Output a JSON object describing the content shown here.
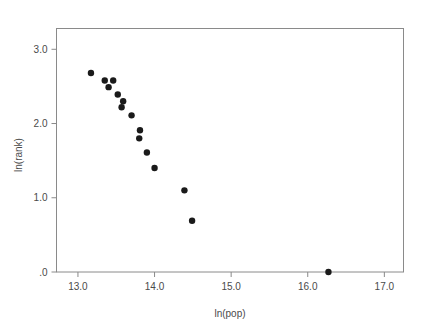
{
  "chart": {
    "type": "scatter",
    "title": "",
    "background_color": "#ffffff",
    "marker_color": "#1a1a1a",
    "axis_color": "#8a8a8a",
    "text_color": "#4a4a4a"
  },
  "chart_data": {
    "type": "scatter",
    "title": "",
    "subtitle": "",
    "xlabel": "ln(pop)",
    "ylabel": "ln(rank)",
    "xlim": [
      12.72,
      17.25
    ],
    "ylim": [
      0.0,
      3.28
    ],
    "grid": false,
    "legend": null,
    "xticks": [
      13.0,
      14.0,
      15.0,
      16.0,
      17.0
    ],
    "xtick_labels": [
      "13.0",
      "14.0",
      "15.0",
      "16.0",
      "17.0"
    ],
    "yticks": [
      0.0,
      1.0,
      2.0,
      3.0
    ],
    "ytick_labels": [
      ".0",
      "1.0",
      "2.0",
      "3.0"
    ],
    "series": [
      {
        "name": "cities",
        "points": [
          {
            "x": 13.17,
            "y": 2.68
          },
          {
            "x": 13.35,
            "y": 2.58
          },
          {
            "x": 13.46,
            "y": 2.58
          },
          {
            "x": 13.4,
            "y": 2.49
          },
          {
            "x": 13.52,
            "y": 2.39
          },
          {
            "x": 13.59,
            "y": 2.3
          },
          {
            "x": 13.57,
            "y": 2.22
          },
          {
            "x": 13.7,
            "y": 2.11
          },
          {
            "x": 13.81,
            "y": 1.91
          },
          {
            "x": 13.8,
            "y": 1.8
          },
          {
            "x": 13.9,
            "y": 1.61
          },
          {
            "x": 14.0,
            "y": 1.4
          },
          {
            "x": 14.39,
            "y": 1.1
          },
          {
            "x": 14.49,
            "y": 0.69
          },
          {
            "x": 16.27,
            "y": 0.0
          }
        ]
      }
    ]
  },
  "axes": {
    "x_title": "ln(pop)",
    "y_title": "ln(rank)"
  }
}
